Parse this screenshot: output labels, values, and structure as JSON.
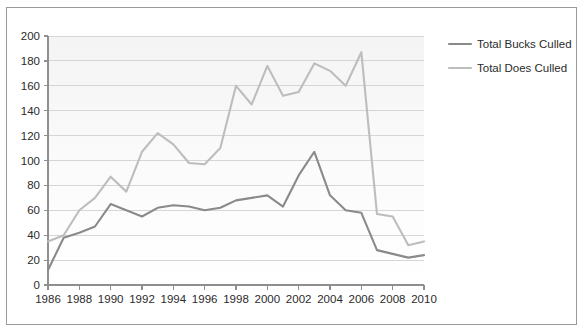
{
  "chart_data": {
    "type": "line",
    "title": "",
    "xlabel": "",
    "ylabel": "",
    "xlim": [
      1986,
      2010
    ],
    "ylim": [
      0,
      200
    ],
    "ytick_step": 20,
    "xtick_step": 2,
    "grid": true,
    "legend_position": "right",
    "x": [
      1986,
      1987,
      1988,
      1989,
      1990,
      1991,
      1992,
      1993,
      1994,
      1995,
      1996,
      1997,
      1998,
      1999,
      2000,
      2001,
      2002,
      2003,
      2004,
      2005,
      2006,
      2007,
      2008,
      2009,
      2010
    ],
    "xtick_labels": [
      "1986",
      "1988",
      "1990",
      "1992",
      "1994",
      "1996",
      "1998",
      "2000",
      "2002",
      "2004",
      "2006",
      "2008",
      "2010"
    ],
    "xtick_values": [
      1986,
      1988,
      1990,
      1992,
      1994,
      1996,
      1998,
      2000,
      2002,
      2004,
      2006,
      2008,
      2010
    ],
    "ytick_labels": [
      "0",
      "20",
      "40",
      "60",
      "80",
      "100",
      "120",
      "140",
      "160",
      "180",
      "200"
    ],
    "ytick_values": [
      0,
      20,
      40,
      60,
      80,
      100,
      120,
      140,
      160,
      180,
      200
    ],
    "series": [
      {
        "name": "Total Bucks Culled",
        "color": "#8a8a8a",
        "values": [
          12,
          38,
          42,
          47,
          65,
          60,
          55,
          62,
          64,
          63,
          60,
          62,
          68,
          70,
          72,
          63,
          88,
          107,
          72,
          60,
          58,
          28,
          25,
          22,
          24
        ]
      },
      {
        "name": "Total Does Culled",
        "color": "#bdbdbd",
        "values": [
          35,
          40,
          60,
          70,
          87,
          75,
          107,
          122,
          113,
          98,
          97,
          110,
          160,
          145,
          176,
          152,
          155,
          178,
          172,
          160,
          187,
          57,
          55,
          32,
          35
        ]
      }
    ]
  },
  "legend": {
    "items": [
      {
        "label": "Total Bucks Culled",
        "color": "#8a8a8a"
      },
      {
        "label": "Total Does Culled",
        "color": "#bdbdbd"
      }
    ]
  }
}
